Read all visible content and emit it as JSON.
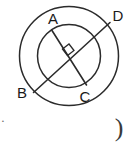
{
  "figure": {
    "stroke_color": "#2b2b2b",
    "background_color": "#ffffff",
    "center": {
      "x": 69,
      "y": 56
    },
    "circles": [
      {
        "name": "outer-circle",
        "cx": 69,
        "cy": 56,
        "r": 49.5
      },
      {
        "name": "inner-circle",
        "cx": 69,
        "cy": 56,
        "r": 31.5
      }
    ],
    "segments": [
      {
        "name": "segment-bd",
        "from": "B",
        "to": "D",
        "x1": 33.5,
        "y1": 92.5,
        "x2": 110.0,
        "y2": 22.5
      },
      {
        "name": "segment-ac",
        "from": "A",
        "to": "C",
        "x1": 52.0,
        "y1": 30.5,
        "x2": 86.5,
        "y2": 85.0
      }
    ],
    "right_angle_marker": {
      "name": "right-angle-marker",
      "points": "62.5,49.0 69.0,44.0 74.0,50.5 67.5,55.5",
      "at_vertex": "center"
    },
    "labels": [
      {
        "name": "vertex-label-a",
        "text": "A",
        "x": 53,
        "y": 20
      },
      {
        "name": "vertex-label-d",
        "text": "D",
        "x": 118,
        "y": 17
      },
      {
        "name": "vertex-label-b",
        "text": "B",
        "x": 22,
        "y": 94
      },
      {
        "name": "vertex-label-c",
        "text": "C",
        "x": 85,
        "y": 98
      }
    ],
    "stray_marks": [
      {
        "name": "stray-paren-glyph",
        "text": ")",
        "x": 119,
        "y": 130
      },
      {
        "name": "stray-tick-mark",
        "text": "·",
        "x": 3,
        "y": 122
      }
    ]
  }
}
